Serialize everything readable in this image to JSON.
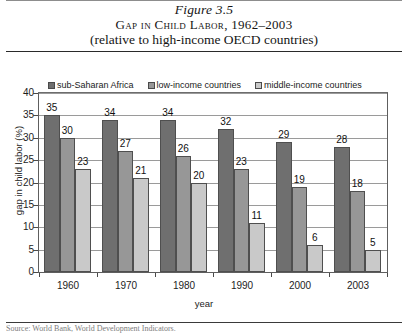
{
  "figure": {
    "number": "Figure 3.5",
    "title": "Gap in Child Labor, 1962–2003",
    "subtitle": "(relative to high-income OECD countries)"
  },
  "footer": {
    "source": "Source: World Bank, World Development Indicators."
  },
  "colors": {
    "series_dark": "#6f6f6f",
    "series_medium": "#979797",
    "series_light": "#c9c9c9",
    "axis": "#5e5e5e",
    "gridline": "#9a9a9a",
    "text": "#1a1a1a"
  },
  "chart_data": {
    "type": "bar",
    "title": "Gap in Child Labor, 1962–2003",
    "subtitle": "(relative to high-income OECD countries)",
    "xlabel": "year",
    "ylabel": "gap in child labor (%)",
    "ylim": [
      0,
      40
    ],
    "yticks": [
      0,
      5,
      10,
      15,
      20,
      25,
      30,
      35,
      40
    ],
    "grid": true,
    "legend_position": "top-inside",
    "categories": [
      "1960",
      "1970",
      "1980",
      "1990",
      "2000",
      "2003"
    ],
    "series": [
      {
        "name": "sub-Saharan Africa",
        "color": "#6f6f6f",
        "values": [
          35,
          34,
          34,
          32,
          29,
          28
        ]
      },
      {
        "name": "low-income countries",
        "color": "#979797",
        "values": [
          30,
          27,
          26,
          23,
          19,
          18
        ]
      },
      {
        "name": "middle-income countries",
        "color": "#c9c9c9",
        "values": [
          23,
          21,
          20,
          11,
          6,
          5
        ]
      }
    ]
  }
}
